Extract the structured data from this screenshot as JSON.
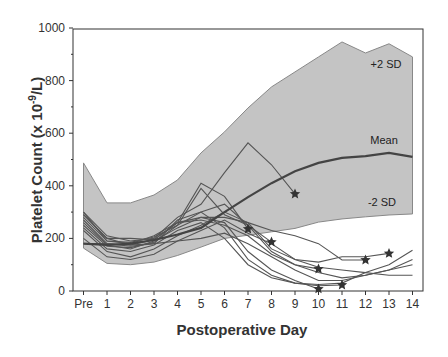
{
  "chart_data": {
    "type": "line",
    "title": "",
    "xlabel": "Postoperative Day",
    "ylabel": "Platelet Count (x 10-9/L)",
    "ylim": [
      0,
      1000
    ],
    "yticks": [
      0,
      200,
      400,
      600,
      800,
      1000
    ],
    "categories": [
      "Pre",
      "1",
      "2",
      "3",
      "4",
      "5",
      "6",
      "7",
      "8",
      "9",
      "10",
      "11",
      "12",
      "13",
      "14"
    ],
    "grid": false,
    "band": {
      "upper_name": "+2 SD",
      "lower_name": "-2 SD",
      "upper": [
        487,
        335,
        335,
        365,
        422,
        525,
        605,
        696,
        776,
        833,
        890,
        947,
        905,
        940,
        890
      ],
      "lower": [
        163,
        105,
        100,
        110,
        135,
        167,
        200,
        212,
        225,
        238,
        262,
        274,
        282,
        289,
        293
      ]
    },
    "series": [
      {
        "name": "Mean",
        "values": [
          180,
          175,
          180,
          194,
          215,
          240,
          300,
          357,
          410,
          455,
          487,
          506,
          513,
          525,
          510
        ]
      },
      {
        "name": "Patient 1",
        "values": [
          300,
          210,
          190,
          200,
          280,
          330,
          450,
          563,
          480,
          369,
          null,
          null,
          null,
          null,
          null
        ]
      },
      {
        "name": "Patient 2",
        "values": [
          290,
          200,
          175,
          195,
          260,
          410,
          360,
          236,
          null,
          null,
          null,
          null,
          null,
          null,
          null
        ]
      },
      {
        "name": "Patient 3",
        "values": [
          280,
          190,
          185,
          205,
          250,
          390,
          290,
          250,
          186,
          null,
          null,
          null,
          null,
          null,
          null
        ]
      },
      {
        "name": "Patient 4",
        "values": [
          270,
          180,
          170,
          180,
          270,
          300,
          330,
          250,
          150,
          100,
          84,
          null,
          null,
          null,
          null
        ]
      },
      {
        "name": "Patient 5",
        "values": [
          260,
          175,
          160,
          190,
          240,
          280,
          260,
          150,
          80,
          40,
          8,
          null,
          null,
          null,
          null
        ]
      },
      {
        "name": "Patient 6",
        "values": [
          250,
          170,
          165,
          185,
          250,
          300,
          240,
          120,
          60,
          30,
          20,
          23,
          null,
          null,
          null
        ]
      },
      {
        "name": "Patient 7",
        "values": [
          240,
          160,
          150,
          175,
          230,
          260,
          200,
          100,
          50,
          30,
          25,
          30,
          70,
          100,
          155
        ]
      },
      {
        "name": "Patient 8",
        "values": [
          300,
          190,
          180,
          210,
          260,
          280,
          280,
          260,
          230,
          210,
          180,
          118,
          118,
          null,
          null
        ]
      },
      {
        "name": "Patient 9",
        "values": [
          230,
          150,
          130,
          160,
          210,
          250,
          300,
          260,
          160,
          120,
          110,
          130,
          130,
          143,
          null
        ]
      },
      {
        "name": "Patient 10",
        "values": [
          200,
          130,
          120,
          140,
          190,
          230,
          270,
          220,
          180,
          120,
          90,
          80,
          70,
          60,
          60
        ]
      },
      {
        "name": "Patient 11",
        "values": [
          180,
          180,
          175,
          180,
          190,
          200,
          220,
          180,
          130,
          80,
          40,
          40,
          60,
          80,
          120
        ]
      },
      {
        "name": "Patient 12",
        "values": [
          290,
          200,
          200,
          195,
          260,
          270,
          250,
          210,
          140,
          100,
          70,
          50,
          60,
          80,
          100
        ]
      }
    ],
    "markers": [
      {
        "label": "star",
        "x": "9",
        "y": 369
      },
      {
        "label": "star",
        "x": "7",
        "y": 236
      },
      {
        "label": "star",
        "x": "8",
        "y": 186
      },
      {
        "label": "star",
        "x": "10",
        "y": 84
      },
      {
        "label": "star",
        "x": "10",
        "y": 8
      },
      {
        "label": "star",
        "x": "11",
        "y": 23
      },
      {
        "label": "star",
        "x": "12",
        "y": 118
      },
      {
        "label": "star",
        "x": "13",
        "y": 143
      }
    ],
    "annotations": [
      {
        "text": "+2 SD",
        "x": "13",
        "y": 860
      },
      {
        "text": "Mean",
        "x": "13",
        "y": 570
      },
      {
        "text": "-2 SD",
        "x": "13",
        "y": 340
      }
    ]
  },
  "labels": {
    "ylabel_main": "Platelet Count (x 10",
    "ylabel_sup": "-9",
    "ylabel_end": "/L)",
    "xlabel": "Postoperative Day",
    "upper": "+2 SD",
    "mean": "Mean",
    "lower": "-2 SD"
  },
  "colors": {
    "band": "#c4c4c4",
    "band_edge": "#888888",
    "lines": "#555555",
    "mean": "#444444",
    "axis": "#333333"
  }
}
